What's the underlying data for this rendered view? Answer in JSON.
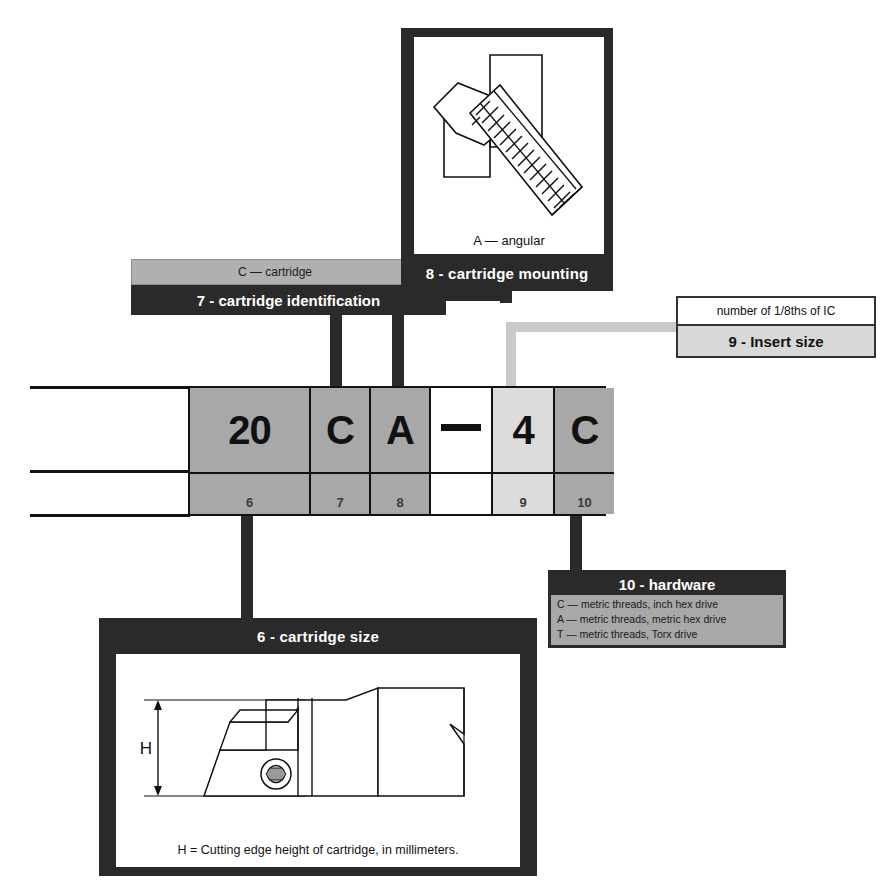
{
  "diagram": {
    "code": {
      "cells": [
        {
          "value": "20",
          "index": "6",
          "shade": "sh-dark"
        },
        {
          "value": "C",
          "index": "7",
          "shade": "sh-dark"
        },
        {
          "value": "A",
          "index": "8",
          "shade": "sh-dark"
        },
        {
          "value": "—",
          "index": "",
          "shade": "sh-white"
        },
        {
          "value": "4",
          "index": "9",
          "shade": "sh-light"
        },
        {
          "value": "C",
          "index": "10",
          "shade": "sh-dark"
        }
      ]
    },
    "callouts": {
      "cartridge_size": {
        "title": "6 - cartridge size",
        "caption": "H = Cutting edge height of cartridge, in millimeters.",
        "dimension_label": "H"
      },
      "cartridge_identification": {
        "value": "C — cartridge",
        "title": "7 - cartridge identification"
      },
      "cartridge_mounting": {
        "caption": "A — angular",
        "title": "8 - cartridge mounting"
      },
      "insert_size": {
        "value": "number of 1/8ths of IC",
        "title": "9 - Insert size"
      },
      "hardware": {
        "title": "10 - hardware",
        "options": [
          "C — metric threads, inch hex drive",
          "A — metric threads, metric hex drive",
          "T — metric threads, Torx drive"
        ]
      }
    },
    "colors": {
      "frame": "#2a2a2a",
      "cell_dark": "#a8a8a8",
      "cell_light": "#dcdcdc",
      "connector_grey": "#c9c9c9"
    }
  }
}
